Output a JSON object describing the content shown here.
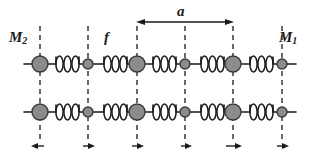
{
  "figure": {
    "background_color": "#ffffff",
    "labels": {
      "mass_heavy": "M",
      "mass_heavy_subscript": "2",
      "mass_light": "M",
      "mass_light_subscript": "1",
      "spring_constant": "f",
      "lattice_constant": "a"
    },
    "colors": {
      "mass_fill": "#8c8c8c",
      "mass_stroke": "#3a3a3a",
      "line": "#1a1a1a",
      "dashed_line": "#2b2b2b",
      "spring_stroke": "#1a1a1a",
      "text": "#1a1a1a"
    },
    "geometry": {
      "width": 317,
      "height": 165,
      "row_top_y": 64,
      "row_bottom_y": 112,
      "dashed_x": [
        40,
        88,
        137,
        185,
        233,
        282
      ],
      "mass_radius_heavy": 8,
      "mass_radius_light": 5,
      "spring_loops": 3,
      "arrow_y": 146,
      "dimension_arrow_y": 22,
      "dimension_arrow_x1": 137,
      "dimension_arrow_x2": 233
    },
    "rows": [
      {
        "name": "upper-chain",
        "y": 64,
        "masses": [
          {
            "x": 40,
            "size": "heavy"
          },
          {
            "x": 88,
            "size": "light"
          },
          {
            "x": 137,
            "size": "heavy"
          },
          {
            "x": 185,
            "size": "light"
          },
          {
            "x": 233,
            "size": "heavy"
          },
          {
            "x": 282,
            "size": "light"
          }
        ]
      },
      {
        "name": "lower-chain",
        "y": 112,
        "masses": [
          {
            "x": 40,
            "size": "heavy"
          },
          {
            "x": 88,
            "size": "light"
          },
          {
            "x": 137,
            "size": "heavy"
          },
          {
            "x": 185,
            "size": "light"
          },
          {
            "x": 233,
            "size": "heavy"
          },
          {
            "x": 282,
            "size": "light"
          }
        ]
      }
    ],
    "displacement_arrows": [
      {
        "x": 40,
        "direction": "left"
      },
      {
        "x": 88,
        "direction": "right"
      },
      {
        "x": 137,
        "direction": "right"
      },
      {
        "x": 185,
        "direction": "right"
      },
      {
        "x": 233,
        "direction": "right"
      },
      {
        "x": 282,
        "direction": "right"
      }
    ]
  }
}
